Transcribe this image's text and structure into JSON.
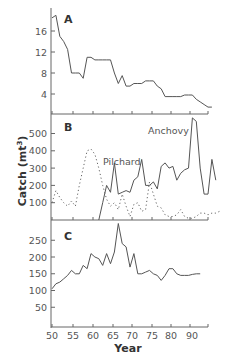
{
  "chart_data": [
    {
      "panel": "A",
      "type": "line",
      "title": "A",
      "xlabel": "Year",
      "ylabel": "",
      "yticks": [
        4,
        8,
        12,
        16
      ],
      "ylim": [
        0,
        20
      ],
      "xlim": [
        50,
        95
      ],
      "series": [
        {
          "name": "A",
          "style": "solid",
          "x": [
            50,
            51,
            52,
            53,
            54,
            55,
            56,
            57,
            58,
            59,
            60,
            61,
            62,
            63,
            64,
            65,
            66,
            67,
            68,
            69,
            70,
            71,
            72,
            73,
            74,
            75,
            76,
            77,
            78,
            79,
            80,
            81,
            82,
            83,
            84,
            85,
            86,
            87,
            88,
            89,
            90,
            91
          ],
          "values": [
            18.5,
            19,
            15,
            14,
            12.5,
            8,
            8,
            8,
            7,
            11,
            11,
            10.5,
            10.5,
            10.5,
            10.5,
            10.5,
            8,
            6,
            7.5,
            5.5,
            5.5,
            6,
            6,
            6,
            6.5,
            6.5,
            6.5,
            5.5,
            5,
            3.5,
            3.5,
            3.5,
            3.5,
            3.5,
            3.8,
            3.8,
            3.8,
            3,
            2.5,
            2,
            1.5,
            1.5
          ]
        }
      ]
    },
    {
      "panel": "B",
      "type": "line",
      "title": "B",
      "xlabel": "Year",
      "ylabel": "Catch (mt³)",
      "yticks": [
        100,
        200,
        300,
        400,
        500
      ],
      "ylim": [
        0,
        600
      ],
      "xlim": [
        50,
        95
      ],
      "series": [
        {
          "name": "Pilchard",
          "style": "dotted",
          "x": [
            50,
            51,
            52,
            53,
            54,
            55,
            56,
            57,
            58,
            59,
            60,
            61,
            62,
            63,
            64,
            65,
            66,
            67,
            68,
            69,
            70,
            71,
            72,
            73,
            74,
            75,
            76,
            77,
            78,
            79,
            80,
            81,
            82,
            83,
            84,
            85,
            86,
            87,
            88,
            89,
            90,
            91,
            92,
            93
          ],
          "values": [
            100,
            170,
            130,
            100,
            80,
            110,
            80,
            200,
            300,
            400,
            410,
            380,
            300,
            200,
            120,
            80,
            100,
            60,
            150,
            80,
            20,
            90,
            100,
            50,
            60,
            220,
            150,
            80,
            70,
            30,
            20,
            20,
            30,
            60,
            20,
            10,
            10,
            20,
            40,
            40,
            30,
            40,
            40,
            50
          ]
        },
        {
          "name": "Anchovy",
          "style": "solid",
          "x": [
            62,
            63,
            64,
            65,
            66,
            67,
            68,
            69,
            70,
            71,
            72,
            73,
            74,
            75,
            76,
            77,
            78,
            79,
            80,
            81,
            82,
            83,
            84,
            85,
            86,
            87,
            88,
            89,
            90,
            91,
            92
          ],
          "values": [
            0,
            100,
            200,
            160,
            330,
            150,
            160,
            170,
            160,
            230,
            250,
            350,
            200,
            200,
            220,
            180,
            310,
            330,
            300,
            310,
            230,
            270,
            290,
            300,
            590,
            570,
            300,
            150,
            150,
            350,
            230
          ]
        }
      ],
      "annotations": [
        "Pilchard",
        "Anchovy"
      ]
    },
    {
      "panel": "C",
      "type": "line",
      "title": "C",
      "xlabel": "Year",
      "ylabel": "",
      "yticks": [
        50,
        100,
        150,
        200,
        250
      ],
      "ylim": [
        0,
        300
      ],
      "xlim": [
        50,
        95
      ],
      "series": [
        {
          "name": "C",
          "style": "solid",
          "x": [
            50,
            51,
            52,
            53,
            54,
            55,
            56,
            57,
            58,
            59,
            60,
            61,
            62,
            63,
            64,
            65,
            66,
            67,
            68,
            69,
            70,
            71,
            72,
            73,
            74,
            75,
            76,
            77,
            78,
            79,
            80,
            81,
            82,
            83,
            84,
            85,
            86,
            87,
            88
          ],
          "values": [
            105,
            120,
            125,
            135,
            145,
            160,
            150,
            150,
            175,
            165,
            210,
            200,
            195,
            175,
            210,
            180,
            215,
            300,
            240,
            230,
            170,
            210,
            150,
            150,
            155,
            160,
            150,
            145,
            130,
            145,
            165,
            165,
            150,
            145,
            145,
            145,
            148,
            150,
            150
          ]
        }
      ]
    }
  ],
  "axes": {
    "x_tick_labels": [
      {
        "label": "50",
        "pos": 52
      },
      {
        "label": "55",
        "pos": 73
      },
      {
        "label": "60",
        "pos": 93
      },
      {
        "label": "65",
        "pos": 113
      },
      {
        "label": "70",
        "pos": 132
      },
      {
        "label": "75",
        "pos": 152
      },
      {
        "label": "80",
        "pos": 171
      },
      {
        "label": "90",
        "pos": 192
      }
    ],
    "xlabel": "Year",
    "ylabel_main": "Catch (mt",
    "ylabel_sup": "3",
    "ylabel_close": ")"
  },
  "labels": {
    "panel_a": "A",
    "panel_b": "B",
    "panel_c": "C",
    "pilchard": "Pilchard",
    "anchovy": "Anchovy"
  },
  "colors": {
    "line": "#555555",
    "axis": "#555555",
    "text": "#555555"
  }
}
